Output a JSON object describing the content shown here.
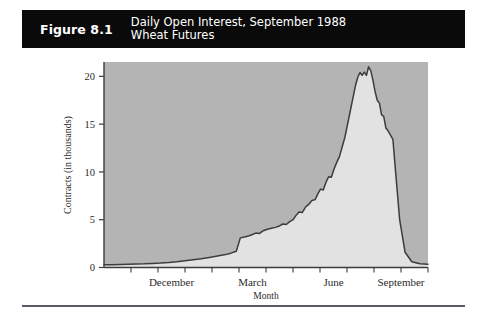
{
  "figure": {
    "number_label": "Figure 8.1",
    "title_line1": "Daily Open Interest, September 1988",
    "title_line2": "Wheat Futures",
    "banner_color": "#0a0a0a",
    "banner_text_color": "#ffffff"
  },
  "chart_data": {
    "type": "area",
    "title": "Daily Open Interest, September 1988 Wheat Futures",
    "xlabel": "Month",
    "ylabel": "Contracts (in thousands)",
    "ylim": [
      0,
      21.5
    ],
    "yticks": [
      0,
      5,
      10,
      15,
      20
    ],
    "ytick_labels": [
      "0",
      "5",
      "10",
      "15",
      "20"
    ],
    "xlim": [
      0,
      12
    ],
    "xtick_count": 12,
    "xtick_labels": [
      "December",
      "March",
      "June",
      "September"
    ],
    "xtick_label_positions": [
      2.5,
      5.5,
      8.5,
      11.0
    ],
    "grid": false,
    "legend": null,
    "fill_above_color": "#b4b4b4",
    "fill_below_color": "#e2e2e2",
    "line_color": "#3c3c3c",
    "series": [
      {
        "name": "Open Interest",
        "x": [
          0.0,
          0.3,
          0.6,
          0.9,
          1.2,
          1.5,
          1.8,
          2.1,
          2.4,
          2.7,
          3.0,
          3.3,
          3.6,
          3.9,
          4.2,
          4.5,
          4.7,
          4.9,
          5.05,
          5.2,
          5.35,
          5.5,
          5.62,
          5.75,
          5.9,
          6.05,
          6.2,
          6.35,
          6.5,
          6.62,
          6.75,
          6.88,
          7.0,
          7.1,
          7.22,
          7.34,
          7.46,
          7.58,
          7.7,
          7.82,
          7.92,
          8.02,
          8.12,
          8.22,
          8.32,
          8.42,
          8.52,
          8.62,
          8.72,
          8.82,
          8.92,
          9.0,
          9.08,
          9.16,
          9.24,
          9.32,
          9.4,
          9.48,
          9.56,
          9.64,
          9.72,
          9.8,
          9.88,
          9.96,
          10.04,
          10.12,
          10.2,
          10.28,
          10.36,
          10.44,
          10.52,
          10.6,
          10.7,
          10.8,
          10.95,
          11.15,
          11.4,
          11.7,
          12.0
        ],
        "y": [
          0.3,
          0.3,
          0.32,
          0.34,
          0.36,
          0.38,
          0.42,
          0.46,
          0.52,
          0.6,
          0.7,
          0.8,
          0.92,
          1.05,
          1.2,
          1.35,
          1.5,
          1.7,
          3.1,
          3.2,
          3.3,
          3.45,
          3.6,
          3.55,
          3.85,
          4.0,
          4.1,
          4.2,
          4.35,
          4.55,
          4.5,
          4.8,
          5.0,
          5.4,
          5.8,
          5.75,
          6.3,
          6.6,
          7.0,
          7.1,
          7.7,
          8.2,
          8.1,
          8.9,
          9.5,
          9.45,
          10.3,
          11.0,
          11.6,
          12.6,
          13.6,
          14.7,
          15.8,
          16.9,
          18.0,
          19.1,
          19.9,
          20.4,
          20.1,
          20.45,
          20.1,
          21.0,
          20.6,
          19.6,
          18.4,
          17.5,
          17.2,
          16.0,
          15.8,
          14.6,
          14.3,
          13.9,
          13.4,
          10.0,
          5.0,
          1.6,
          0.6,
          0.4,
          0.35
        ]
      }
    ]
  },
  "axes": {
    "y_axis_title": "Contracts (in thousands)",
    "x_axis_title": "Month"
  }
}
